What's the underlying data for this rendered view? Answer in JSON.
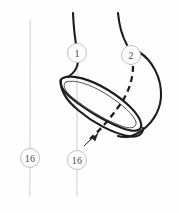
{
  "figure": {
    "background_color": "#fefefe",
    "width": 179,
    "height": 213,
    "ink_color": "#1d1d1d",
    "guide_color": "#d2d2d2",
    "label_color": "#4a4a4a"
  },
  "labels": {
    "strand_one": "1",
    "strand_two": "2",
    "left_marker": "16",
    "center_marker": "16"
  },
  "nodes": [
    {
      "id": "node-strand-one",
      "label": "1",
      "cx": 77,
      "cy": 53,
      "r": 9.5
    },
    {
      "id": "node-strand-two",
      "label": "2",
      "cx": 131,
      "cy": 55,
      "r": 9.5
    },
    {
      "id": "node-left-marker",
      "label": "16",
      "cx": 30,
      "cy": 158,
      "r": 9.5
    },
    {
      "id": "node-center-marker",
      "label": "16",
      "cx": 77,
      "cy": 160,
      "r": 9.5
    }
  ],
  "guides": [
    {
      "id": "guide-left",
      "x": 30,
      "y_top": 20,
      "y_bottom": 196
    },
    {
      "id": "guide-center",
      "x": 77,
      "y_top": 44,
      "y_bottom": 196
    }
  ],
  "annotations": {
    "dashed_strand": "hidden strand passing behind band",
    "arrow_direction": "down-left"
  }
}
